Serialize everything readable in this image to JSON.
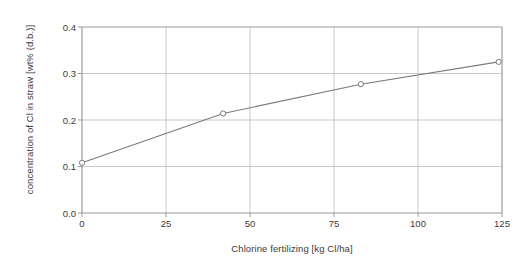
{
  "chart_data": {
    "type": "line",
    "title": "",
    "subtitle": "",
    "xlabel": "Chlorine fertilizing [kg Cl/ha]",
    "ylabel": "concentration of Cl in straw [wt% (d.b.)]",
    "x": [
      0,
      42,
      83,
      124
    ],
    "values": [
      0.108,
      0.214,
      0.277,
      0.325
    ],
    "series": [
      {
        "name": "concentration of Cl in straw",
        "x": [
          0,
          42,
          83,
          124
        ],
        "values": [
          0.108,
          0.214,
          0.277,
          0.325
        ]
      }
    ],
    "xlim": [
      0,
      125
    ],
    "ylim": [
      0.0,
      0.4
    ],
    "xticks": [
      0,
      25,
      50,
      75,
      100,
      125
    ],
    "yticks": [
      0.0,
      0.1,
      0.2,
      0.3,
      0.4
    ],
    "xtick_labels": [
      "0",
      "25",
      "50",
      "75",
      "100",
      "125"
    ],
    "ytick_labels": [
      "0.0",
      "0.1",
      "0.2",
      "0.3",
      "0.4"
    ],
    "grid": true,
    "grid_x": true,
    "grid_y": true,
    "legend": false,
    "legend_position": "none",
    "marker": "open-circle",
    "line_color": "#7a7a7a",
    "marker_color": "#7a7a7a",
    "grid_color": "#c8c8c8",
    "axis_color": "#9a9a9a",
    "text_color": "#3a3a3a",
    "background": "#ffffff"
  },
  "axes": {
    "y_tick_0": "0.0",
    "y_tick_1": "0.1",
    "y_tick_2": "0.2",
    "y_tick_3": "0.3",
    "y_tick_4": "0.4",
    "x_tick_0": "0",
    "x_tick_1": "25",
    "x_tick_2": "50",
    "x_tick_3": "75",
    "x_tick_4": "100",
    "x_tick_5": "125",
    "x_axis_title": "Chlorine fertilizing [kg Cl/ha]",
    "y_axis_title": "concentration of Cl in straw [wt% (d.b.)]"
  }
}
